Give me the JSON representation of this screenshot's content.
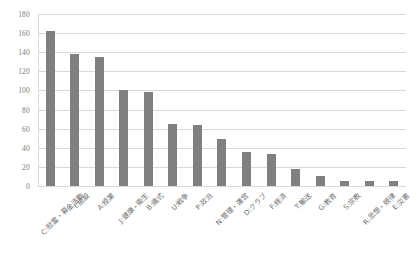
{
  "chart_data": {
    "type": "bar",
    "title": "",
    "subtitle": "",
    "xlabel": "",
    "ylabel": "",
    "ylim": [
      0,
      180
    ],
    "ytick_step": 20,
    "yticks": [
      180,
      160,
      140,
      120,
      100,
      80,
      60,
      40,
      20,
      0
    ],
    "grid": true,
    "legend": false,
    "legend_position": "none",
    "bar_color": "#808080",
    "gridline_color": "#d9d9d9",
    "tick_label_color": "#7a7a7a",
    "categories": [
      "C:慰霊・募金活動",
      "I:施設",
      "A:授業",
      "J:健康・衛生",
      "B:儀式",
      "U:戦争",
      "P:政治",
      "N:管理・運営",
      "D:クラブ",
      "F:経済",
      "T:輸送",
      "G:教育",
      "S:宗教",
      "R:思想・規律",
      "E:災害"
    ],
    "values": [
      162,
      138,
      135,
      101,
      98,
      65,
      64,
      49,
      36,
      34,
      18,
      10,
      5,
      5,
      5
    ]
  }
}
